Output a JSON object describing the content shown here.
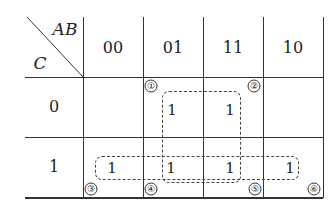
{
  "kmap": {
    "row_variable": "C",
    "col_variables": "AB",
    "col_headers": [
      "00",
      "01",
      "11",
      "10"
    ],
    "row_headers": [
      "0",
      "1"
    ],
    "cells": [
      [
        "",
        "1",
        "1",
        ""
      ],
      [
        "1",
        "1",
        "1",
        "1"
      ]
    ],
    "markers": [
      "①",
      "②",
      "③",
      "④",
      "⑤",
      "⑥"
    ],
    "groups": [
      {
        "name": "vertical-square",
        "cells": "AB=01,11 / C=0,1"
      },
      {
        "name": "bottom-row",
        "cells": "C=1 / AB=00,01,11,10"
      }
    ],
    "colors": {
      "line": "#333333",
      "background": "#ffffff"
    }
  }
}
